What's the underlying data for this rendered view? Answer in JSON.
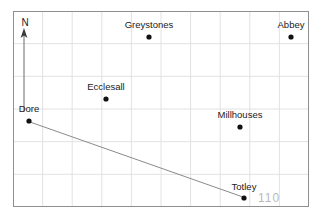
{
  "figure": {
    "kind": "map",
    "title": "",
    "background_color": "#ffffff",
    "frame": {
      "x": 13,
      "y": 11,
      "width": 296,
      "height": 196,
      "border_color": "#8f8f8f",
      "grid_color": "#e2e2e2",
      "grid_columns": 10,
      "grid_rows": 6
    }
  },
  "compass": {
    "label": "N",
    "label_x": 25,
    "label_y": 26,
    "arrow_from_x": 24,
    "arrow_from_y": 112,
    "arrow_to_x": 24,
    "arrow_to_y": 31,
    "color": "#4a4a4a"
  },
  "places": [
    {
      "name": "Greystones",
      "dot_x": 149,
      "dot_y": 37,
      "label_x": 149,
      "label_y": 28,
      "label_anchor": "middle"
    },
    {
      "name": "Abbey",
      "dot_x": 291,
      "dot_y": 37,
      "label_x": 291,
      "label_y": 28,
      "label_anchor": "middle"
    },
    {
      "name": "Ecclesall",
      "dot_x": 106,
      "dot_y": 99,
      "label_x": 106,
      "label_y": 90,
      "label_anchor": "middle"
    },
    {
      "name": "Dore",
      "dot_x": 29,
      "dot_y": 121,
      "label_x": 29,
      "label_y": 112,
      "label_anchor": "middle"
    },
    {
      "name": "Millhouses",
      "dot_x": 240,
      "dot_y": 127,
      "label_x": 240,
      "label_y": 118,
      "label_anchor": "middle"
    },
    {
      "name": "Totley",
      "dot_x": 244,
      "dot_y": 198,
      "label_x": 244,
      "label_y": 190,
      "label_anchor": "middle"
    }
  ],
  "route": {
    "from": "Dore",
    "to": "Totley",
    "x1": 30,
    "y1": 122,
    "x2": 243,
    "y2": 197,
    "color": "#8a8a8a"
  },
  "annotations": [
    {
      "text": "110",
      "x": 258,
      "y": 202,
      "color": "#b9b9b9"
    }
  ],
  "dot": {
    "radius": 2.6,
    "color": "#111111"
  }
}
